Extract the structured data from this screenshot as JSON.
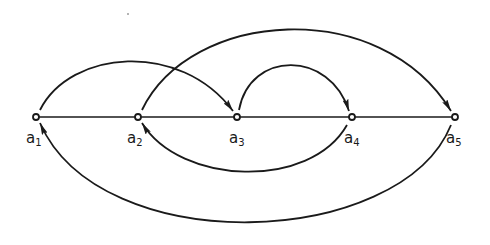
{
  "diagram": {
    "type": "directed-graph",
    "colors": {
      "stroke": "#1a1a1a",
      "background": "#ffffff"
    },
    "nodes": [
      {
        "id": "a1",
        "base": "a",
        "index": "1",
        "x": 36,
        "y": 117
      },
      {
        "id": "a2",
        "base": "a",
        "index": "2",
        "x": 138,
        "y": 117
      },
      {
        "id": "a3",
        "base": "a",
        "index": "3",
        "x": 237,
        "y": 117
      },
      {
        "id": "a4",
        "base": "a",
        "index": "4",
        "x": 352,
        "y": 117
      },
      {
        "id": "a5",
        "base": "a",
        "index": "5",
        "x": 455,
        "y": 117
      }
    ],
    "baseline": {
      "from": "a1",
      "to": "a5",
      "directed": false
    },
    "edges": [
      {
        "from": "a1",
        "to": "a3",
        "side": "above"
      },
      {
        "from": "a2",
        "to": "a5",
        "side": "above"
      },
      {
        "from": "a3",
        "to": "a4",
        "side": "above"
      },
      {
        "from": "a4",
        "to": "a2",
        "side": "below"
      },
      {
        "from": "a5",
        "to": "a1",
        "side": "below"
      }
    ]
  }
}
